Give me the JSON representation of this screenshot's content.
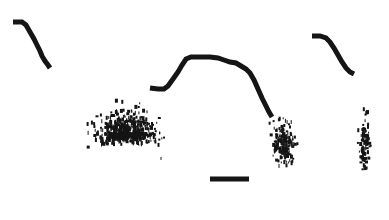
{
  "figure": {
    "title": "",
    "background_color": "#ffffff",
    "ink_color": "#151515",
    "width": 389,
    "height": 220
  },
  "chart_data": {
    "type": "scatter",
    "title": "",
    "xlabel": "",
    "ylabel": "",
    "grid": false,
    "legend": "none",
    "xlim": [
      0,
      389
    ],
    "ylim": [
      220,
      0
    ],
    "elements": [
      {
        "name": "left-trace",
        "kind": "line",
        "points": [
          [
            13,
            22
          ],
          [
            22,
            22
          ],
          [
            26,
            25
          ],
          [
            30,
            32
          ],
          [
            34,
            39
          ],
          [
            37,
            45
          ],
          [
            40,
            51
          ],
          [
            42,
            56
          ],
          [
            45,
            61
          ],
          [
            48,
            65
          ],
          [
            50,
            68
          ]
        ]
      },
      {
        "name": "center-trace",
        "kind": "line",
        "points": [
          [
            150,
            88
          ],
          [
            158,
            89
          ],
          [
            164,
            89
          ],
          [
            168,
            86
          ],
          [
            173,
            79
          ],
          [
            178,
            72
          ],
          [
            182,
            65
          ],
          [
            186,
            59
          ],
          [
            191,
            57
          ],
          [
            200,
            57
          ],
          [
            210,
            57
          ],
          [
            218,
            58
          ],
          [
            224,
            60
          ],
          [
            230,
            62
          ],
          [
            236,
            63
          ],
          [
            241,
            66
          ],
          [
            246,
            69
          ],
          [
            250,
            73
          ],
          [
            254,
            80
          ],
          [
            258,
            89
          ],
          [
            262,
            98
          ],
          [
            266,
            106
          ],
          [
            269,
            112
          ],
          [
            272,
            117
          ]
        ]
      },
      {
        "name": "right-trace",
        "kind": "line",
        "points": [
          [
            312,
            36
          ],
          [
            320,
            36
          ],
          [
            326,
            38
          ],
          [
            330,
            42
          ],
          [
            334,
            48
          ],
          [
            338,
            55
          ],
          [
            342,
            62
          ],
          [
            346,
            68
          ],
          [
            350,
            72
          ],
          [
            354,
            74
          ]
        ]
      },
      {
        "name": "scale-bar",
        "kind": "bar",
        "x0": 210,
        "x1": 249,
        "y": 179,
        "thickness": 5
      },
      {
        "name": "cluster-left",
        "kind": "dot-cloud",
        "center": [
          125,
          132
        ],
        "radius_x": 58,
        "radius_y": 48,
        "n_points": 560,
        "density": "high"
      },
      {
        "name": "cluster-center-right",
        "kind": "dot-cloud",
        "center": [
          283,
          142
        ],
        "radius_x": 22,
        "radius_y": 42,
        "n_points": 190,
        "density": "medium"
      },
      {
        "name": "cluster-far-right",
        "kind": "dot-cloud",
        "center": [
          364,
          140
        ],
        "radius_x": 11,
        "radius_y": 55,
        "n_points": 110,
        "density": "low"
      }
    ]
  }
}
